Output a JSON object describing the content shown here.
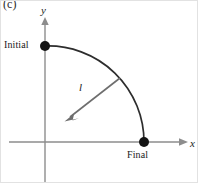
{
  "figure": {
    "panel_label": "(c)",
    "background_color": "#ffffff",
    "width": 198,
    "height": 183
  },
  "axes": {
    "x_label": "x",
    "y_label": "y",
    "axis_color": "#8d8d8d",
    "x_axis": {
      "x1": 8,
      "y1": 141,
      "x2": 180,
      "y2": 141
    },
    "y_axis": {
      "x1": 44,
      "y1": 20,
      "x2": 44,
      "y2": 183
    }
  },
  "points": [
    {
      "name": "initial",
      "label": "Initial",
      "x": 44,
      "y": 45,
      "radius": 5,
      "color": "#141414"
    },
    {
      "name": "final",
      "label": "Final",
      "x": 143,
      "y": 141,
      "radius": 5,
      "color": "#141414"
    }
  ],
  "arc": {
    "name": "trajectory-arc",
    "from_x": 44,
    "from_y": 45,
    "to_x": 143,
    "to_y": 141,
    "center_x": 44,
    "center_y": 141,
    "radius": 97,
    "color": "#2d2d2d",
    "stroke_width": 1.7
  },
  "vector": {
    "name": "displacement-vector",
    "label": "l",
    "tail_x": 119,
    "tail_y": 77,
    "head_x": 65,
    "head_y": 119,
    "color": "#6e6e6e",
    "stroke_width": 1.6
  },
  "colors": {
    "axis": "#8d8d8d",
    "arc": "#2d2d2d",
    "vector": "#6e6e6e",
    "point": "#141414",
    "text": "#1a1a1a",
    "background": "#ffffff"
  }
}
